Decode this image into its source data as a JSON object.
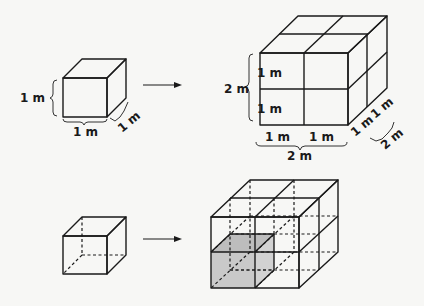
{
  "colors": {
    "background": "#f7f7f5",
    "face_front": "#c9c9c9",
    "face_top": "#bdbdbd",
    "face_side": "#d2d2d2",
    "edge": "#1a1a1a"
  },
  "top_row": {
    "small_cube": {
      "height_label": "1 m",
      "width_label": "1 m",
      "depth_label": "1 m"
    },
    "arrow": "right-arrow",
    "large_cube": {
      "total_height_label": "2 m",
      "height_parts": [
        "1 m",
        "1 m"
      ],
      "width_parts": [
        "1 m",
        "1 m"
      ],
      "total_width_label": "2 m",
      "depth_parts": [
        "1 m",
        "1 m"
      ],
      "total_depth_label": "2 m"
    }
  },
  "bottom_row": {
    "small_cube": "unit cube with hidden edges dashed",
    "arrow": "right-arrow",
    "large_cube": "2x2x2 wireframe cube with one shaded unit cube at front-bottom-left"
  }
}
